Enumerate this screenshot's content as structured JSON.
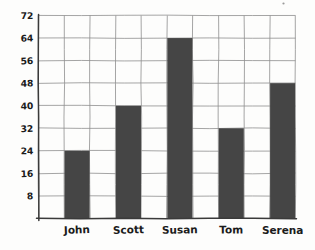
{
  "chart_data": {
    "type": "bar",
    "title": "",
    "subtitle": "",
    "xlabel": "",
    "ylabel": "",
    "categories": [
      "John",
      "Scott",
      "Susan",
      "Tom",
      "Serena"
    ],
    "values": [
      24,
      40,
      64,
      32,
      48
    ],
    "ylim": [
      0,
      72
    ],
    "ytick_labels": [
      "8",
      "16",
      "24",
      "32",
      "40",
      "48",
      "56",
      "64",
      "72"
    ],
    "ytick_values": [
      8,
      16,
      24,
      32,
      40,
      48,
      56,
      64,
      72
    ],
    "ytick_step": 8,
    "grid": true,
    "grid_vertical_columns": 10,
    "legend": false,
    "legend_position": "none",
    "annotations": [],
    "style": "hand-drawn sketch on paper",
    "colors": {
      "bar": "#454545",
      "gridline": "#8e8e8e",
      "axis": "#3a3a3a",
      "text": "#1b1b1b",
      "background": "#fdfdfc"
    }
  },
  "figure": {
    "speck_mark": "·"
  }
}
